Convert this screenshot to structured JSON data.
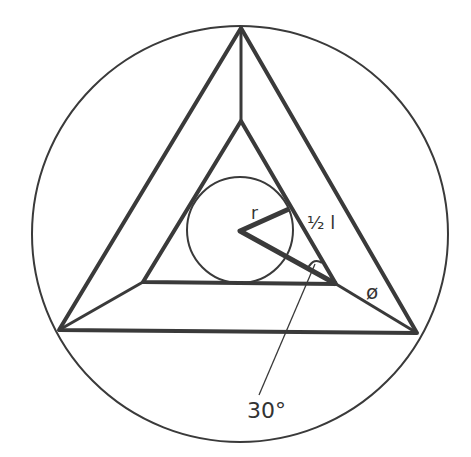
{
  "diagram": {
    "type": "geometric construction",
    "labels": {
      "radius": "r",
      "half_side": "½ l",
      "angle": "30°",
      "diameter_symbol": "ø"
    },
    "colors": {
      "stroke": "#3a3a3a",
      "background": "#ffffff"
    }
  }
}
